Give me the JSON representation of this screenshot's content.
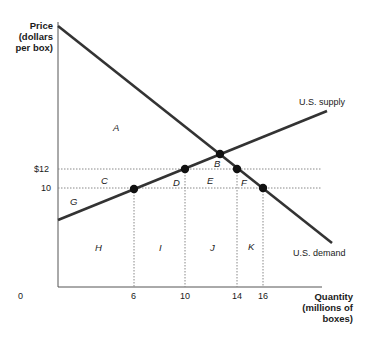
{
  "axes": {
    "y_title_lines": [
      "Price",
      "(dollars",
      "per box)"
    ],
    "x_title_lines": [
      "Quantity",
      "(millions of",
      "boxes)"
    ],
    "origin": "0",
    "y_ticks": [
      {
        "label": "$12",
        "value": 12
      },
      {
        "label": "10",
        "value": 10
      }
    ],
    "x_ticks": [
      {
        "label": "6",
        "value": 6
      },
      {
        "label": "10",
        "value": 10
      },
      {
        "label": "14",
        "value": 14
      },
      {
        "label": "16",
        "value": 16
      }
    ]
  },
  "curves": {
    "supply_label": "U.S. supply",
    "demand_label": "U.S. demand"
  },
  "areas": [
    "A",
    "B",
    "C",
    "D",
    "E",
    "F",
    "G",
    "H",
    "I",
    "J",
    "K"
  ],
  "points": [
    {
      "curve": "supply",
      "quantity": 6,
      "price": 10
    },
    {
      "curve": "supply",
      "quantity": 10,
      "price": 12
    },
    {
      "curve": "both",
      "name": "equilibrium",
      "quantity": 13,
      "price": 13
    },
    {
      "curve": "demand",
      "quantity": 14,
      "price": 12
    },
    {
      "curve": "demand",
      "quantity": 16,
      "price": 10
    }
  ],
  "colors": {
    "line": "#333333",
    "dotted": "#888888",
    "axis": "#555555"
  }
}
